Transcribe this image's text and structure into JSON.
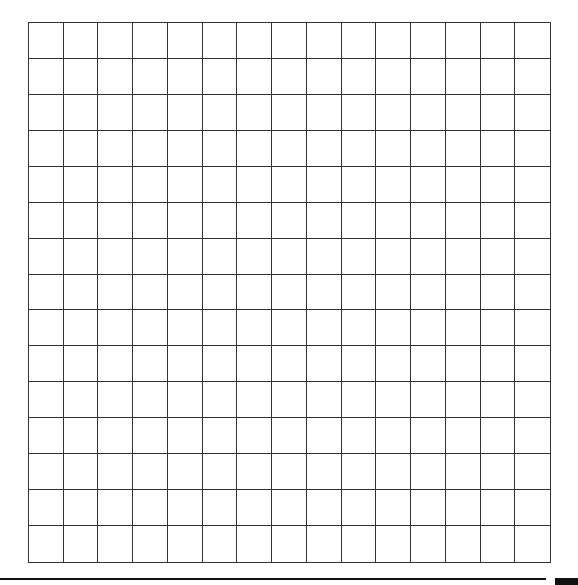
{
  "grid": {
    "rows": 15,
    "cols": 15,
    "line_color": "#333333",
    "background": "#ffffff"
  },
  "footer": {
    "rule_color": "#111111",
    "block_color": "#111111"
  }
}
